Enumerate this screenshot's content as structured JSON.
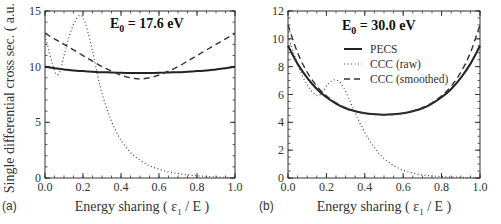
{
  "figure": {
    "ylabel": "Single differential cross sec. ( a.u. )",
    "xlabel_prefix": "Energy sharing ( ε",
    "xlabel_sub": "1",
    "xlabel_suffix": " / E )"
  },
  "legend": [
    {
      "label": "PECS",
      "style": "solid"
    },
    {
      "label": "CCC (raw)",
      "style": "dotted"
    },
    {
      "label": "CCC (smoothed)",
      "style": "dashed"
    }
  ],
  "chart_data": [
    {
      "type": "line",
      "panel": "(a)",
      "title": "E0 = 17.6 eV",
      "title_main": "E",
      "title_sub": "0",
      "title_rest": " = 17.6 eV",
      "xlabel": "Energy sharing ( ε1 / E )",
      "ylabel": "Single differential cross sec. ( a.u. )",
      "xlim": [
        0.0,
        1.0
      ],
      "ylim": [
        0,
        15
      ],
      "xticks": [
        "0.0",
        "0.2",
        "0.4",
        "0.6",
        "0.8",
        "1.0"
      ],
      "yticks": [
        "0",
        "5",
        "10",
        "15"
      ],
      "ytick_values": [
        0,
        5,
        10,
        15
      ],
      "grid": false,
      "legend_position": "none",
      "x": [
        0.0,
        0.05,
        0.1,
        0.15,
        0.2,
        0.25,
        0.3,
        0.35,
        0.4,
        0.45,
        0.5,
        0.55,
        0.6,
        0.65,
        0.7,
        0.75,
        0.8,
        0.85,
        0.9,
        0.95,
        1.0
      ],
      "series": [
        {
          "name": "PECS",
          "style": "solid",
          "values": [
            10.0,
            9.85,
            9.75,
            9.65,
            9.6,
            9.55,
            9.5,
            9.48,
            9.45,
            9.43,
            9.42,
            9.43,
            9.45,
            9.48,
            9.5,
            9.55,
            9.6,
            9.65,
            9.75,
            9.85,
            10.0
          ]
        },
        {
          "name": "CCC (raw)",
          "style": "dotted",
          "x": [
            0.0,
            0.02,
            0.04,
            0.06,
            0.08,
            0.1,
            0.12,
            0.15,
            0.18,
            0.2,
            0.22,
            0.25,
            0.28,
            0.3,
            0.33,
            0.36,
            0.4,
            0.45,
            0.5,
            0.55,
            0.6,
            0.65,
            0.7,
            0.75,
            0.8,
            0.85,
            0.9,
            0.95,
            1.0
          ],
          "values": [
            12.8,
            11.5,
            10.2,
            9.3,
            9.6,
            11.0,
            12.3,
            13.8,
            14.6,
            14.4,
            13.5,
            11.4,
            9.0,
            7.6,
            6.0,
            4.7,
            3.4,
            2.3,
            1.6,
            1.1,
            0.8,
            0.55,
            0.4,
            0.28,
            0.2,
            0.14,
            0.1,
            0.06,
            0.03
          ]
        },
        {
          "name": "CCC (smoothed)",
          "style": "dashed",
          "values": [
            13.0,
            12.5,
            12.0,
            11.5,
            11.0,
            10.5,
            10.0,
            9.6,
            9.25,
            9.0,
            8.9,
            9.0,
            9.25,
            9.6,
            10.0,
            10.5,
            11.0,
            11.5,
            12.0,
            12.5,
            13.0
          ]
        }
      ]
    },
    {
      "type": "line",
      "panel": "(b)",
      "title": "E0 = 30.0 eV",
      "title_main": "E",
      "title_sub": "0",
      "title_rest": " = 30.0 eV",
      "xlabel": "Energy sharing ( ε1 / E )",
      "ylabel": "",
      "xlim": [
        0.0,
        1.0
      ],
      "ylim": [
        0,
        12
      ],
      "xticks": [
        "0.0",
        "0.2",
        "0.4",
        "0.6",
        "0.8",
        "1.0"
      ],
      "yticks": [
        "0",
        "2",
        "4",
        "6",
        "8",
        "10",
        "12"
      ],
      "ytick_values": [
        0,
        2,
        4,
        6,
        8,
        10,
        12
      ],
      "grid": false,
      "legend_position": "upper center",
      "x": [
        0.0,
        0.05,
        0.1,
        0.15,
        0.2,
        0.25,
        0.3,
        0.35,
        0.4,
        0.45,
        0.5,
        0.55,
        0.6,
        0.65,
        0.7,
        0.75,
        0.8,
        0.85,
        0.9,
        0.95,
        1.0
      ],
      "series": [
        {
          "name": "PECS",
          "style": "solid",
          "values": [
            9.5,
            8.2,
            7.2,
            6.4,
            5.8,
            5.35,
            5.0,
            4.8,
            4.65,
            4.58,
            4.55,
            4.58,
            4.65,
            4.8,
            5.0,
            5.35,
            5.8,
            6.4,
            7.2,
            8.2,
            9.5
          ]
        },
        {
          "name": "CCC (raw)",
          "style": "dotted",
          "x": [
            0.0,
            0.03,
            0.06,
            0.1,
            0.14,
            0.17,
            0.2,
            0.23,
            0.26,
            0.29,
            0.32,
            0.35,
            0.38,
            0.42,
            0.46,
            0.5,
            0.55,
            0.6,
            0.65,
            0.7,
            0.75,
            0.8,
            0.85,
            0.9,
            0.95,
            1.0
          ],
          "values": [
            10.2,
            9.0,
            7.8,
            6.7,
            6.0,
            6.0,
            6.6,
            7.0,
            7.0,
            6.5,
            5.6,
            4.7,
            3.8,
            2.8,
            2.0,
            1.4,
            0.9,
            0.55,
            0.35,
            0.22,
            0.15,
            0.1,
            0.07,
            0.05,
            0.03,
            0.02
          ]
        },
        {
          "name": "CCC (smoothed)",
          "style": "dashed",
          "values": [
            11.0,
            9.0,
            7.6,
            6.6,
            5.9,
            5.4,
            5.05,
            4.82,
            4.66,
            4.58,
            4.55,
            4.58,
            4.66,
            4.82,
            5.05,
            5.4,
            5.9,
            6.6,
            7.6,
            9.0,
            11.0
          ]
        }
      ]
    }
  ]
}
